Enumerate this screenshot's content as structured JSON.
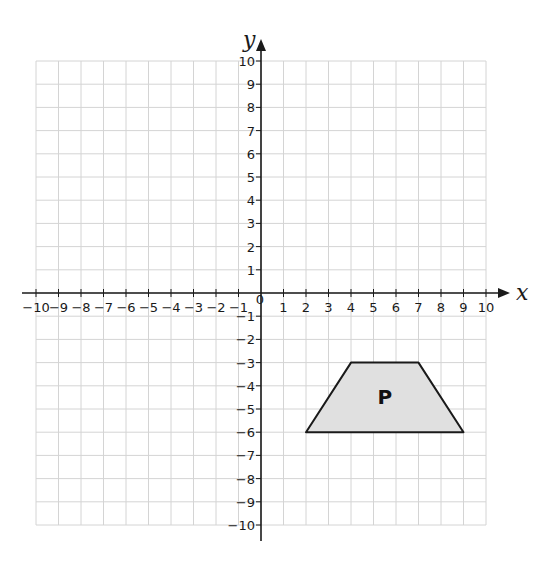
{
  "chart_data": {
    "type": "scatter",
    "title": "",
    "xlabel": "x",
    "ylabel": "y",
    "xlim": [
      -10,
      10
    ],
    "ylim": [
      -10,
      10
    ],
    "grid": true,
    "x_ticks": [
      -10,
      -9,
      -8,
      -7,
      -6,
      -5,
      -4,
      -3,
      -2,
      -1,
      1,
      2,
      3,
      4,
      5,
      6,
      7,
      8,
      9,
      10
    ],
    "y_ticks": [
      -10,
      -9,
      -8,
      -7,
      -6,
      -5,
      -4,
      -3,
      -2,
      -1,
      1,
      2,
      3,
      4,
      5,
      6,
      7,
      8,
      9,
      10
    ],
    "origin_label": "0",
    "shapes": [
      {
        "name": "P",
        "kind": "trapezium",
        "vertices": [
          [
            4,
            -3
          ],
          [
            7,
            -3
          ],
          [
            9,
            -6
          ],
          [
            2,
            -6
          ]
        ],
        "label_position": [
          5.5,
          -4.5
        ]
      }
    ]
  },
  "style": {
    "grid_color": "#d4d4d4",
    "axis_color": "#1a1a1a",
    "shape_fill": "#e0e0e0",
    "shape_stroke": "#1a1a1a"
  },
  "layout": {
    "grid_left": 36,
    "grid_right": 486,
    "grid_top": 61,
    "grid_bottom": 525
  }
}
